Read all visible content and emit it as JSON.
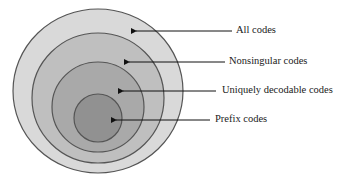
{
  "diagram": {
    "type": "nested-sets",
    "sets": [
      {
        "label": "All codes",
        "fill": "#d8d8d8"
      },
      {
        "label": "Nonsingular codes",
        "fill": "#bdbdbd"
      },
      {
        "label": "Uniquely decodable codes",
        "fill": "#a8a8a8"
      },
      {
        "label": "Prefix codes",
        "fill": "#8f8f8f"
      }
    ],
    "stroke": "#555555"
  }
}
